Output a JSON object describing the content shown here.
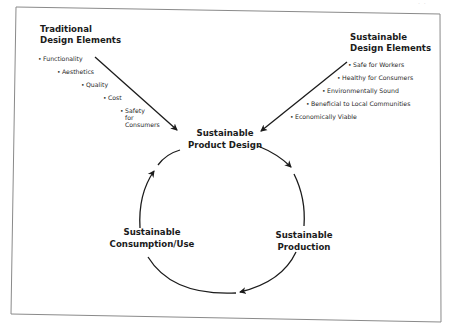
{
  "page_mark": "· ·",
  "traditional": {
    "heading_line1": "Traditional",
    "heading_line2": "Design Elements",
    "items": [
      "Functionality",
      "Aesthetics",
      "Quality",
      "Cost",
      "Safety",
      "for",
      "Consumers"
    ]
  },
  "sustainable_elements": {
    "heading_line1": "Sustainable",
    "heading_line2": "Design Elements",
    "items": [
      "Safe for Workers",
      "Healthy for Consumers",
      "Environmentally Sound",
      "Beneficial to Local Communities",
      "Economically Viable"
    ]
  },
  "cycle": {
    "node_design_line1": "Sustainable",
    "node_design_line2": "Product Design",
    "node_production_line1": "Sustainable",
    "node_production_line2": "Production",
    "node_consumption_line1": "Sustainable",
    "node_consumption_line2": "Consumption/Use"
  },
  "bullet_glyph": "•",
  "colors": {
    "ink": "#1b1b1b",
    "frame": "#7a7a7a",
    "background": "#ffffff"
  }
}
